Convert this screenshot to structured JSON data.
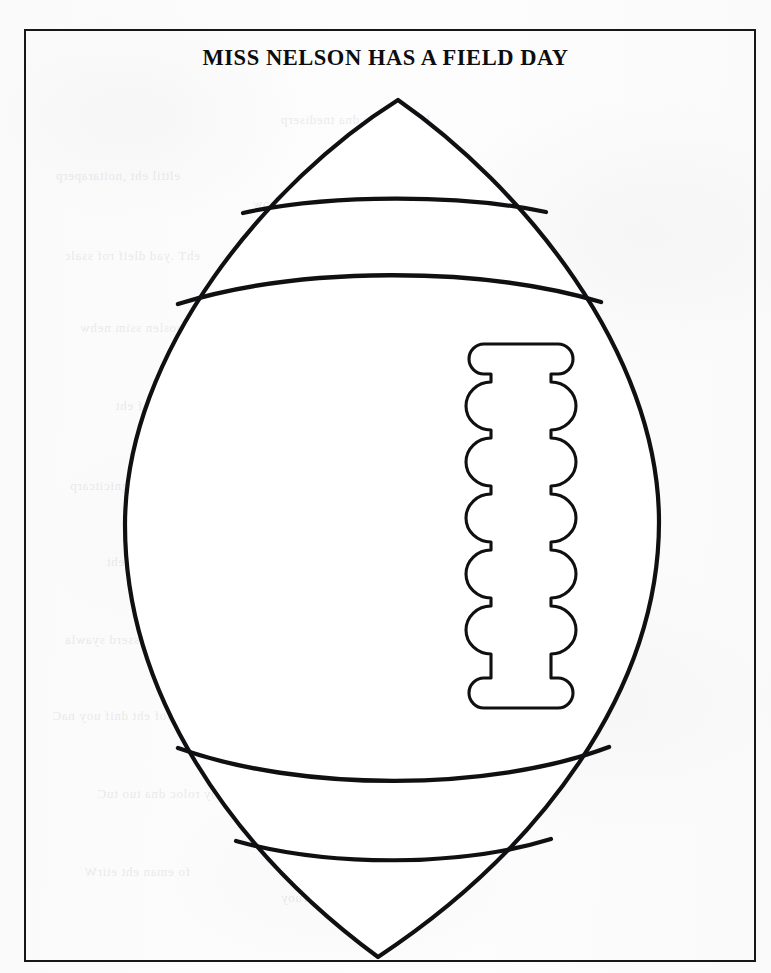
{
  "document": {
    "title": "MISS NELSON HAS A FIELD DAY",
    "page_width": 771,
    "page_height": 973,
    "background_color": "#fdfdfd",
    "ink_color": "#101012",
    "border_color": "#17171a",
    "type": "worksheet-template",
    "subject": "football cut-out / coloring template"
  },
  "frame": {
    "name": "page-border",
    "x": 24,
    "y": 29,
    "width": 732,
    "height": 933,
    "stroke_width": 2,
    "color": "#17171a"
  },
  "artwork": {
    "name": "american-football-outline",
    "stroke_color": "#101012",
    "fill_color": "#ffffff",
    "outline_stroke_width": 4,
    "stripe_stroke_width": 4,
    "lace_stroke_width": 3,
    "ball": {
      "top_tip": {
        "x": 398,
        "y": 100
      },
      "bottom_tip": {
        "x": 378,
        "y": 957
      },
      "left_extent": {
        "x": 125,
        "y": 528
      },
      "right_extent": {
        "x": 659,
        "y": 520
      },
      "center": {
        "x": 392,
        "y": 528
      }
    },
    "stripes": [
      {
        "name": "stripe-top-outer",
        "left_x": 243,
        "right_x": 546,
        "edge_y": 212,
        "apex_y": 196,
        "curve": "arc-up"
      },
      {
        "name": "stripe-top-inner",
        "left_x": 178,
        "right_x": 601,
        "edge_y": 303,
        "apex_y": 269,
        "curve": "arc-up"
      },
      {
        "name": "stripe-bottom-inner",
        "left_x": 178,
        "right_x": 609,
        "edge_y": 748,
        "apex_y": 779,
        "curve": "arc-down"
      },
      {
        "name": "stripe-bottom-outer",
        "left_x": 236,
        "right_x": 551,
        "edge_y": 840,
        "apex_y": 858,
        "curve": "arc-down"
      }
    ],
    "laces": {
      "name": "football-laces",
      "top_cap": {
        "x": 470,
        "y": 344,
        "width": 102,
        "height": 30
      },
      "bottom_cap": {
        "x": 470,
        "y": 678,
        "width": 102,
        "height": 30
      },
      "shaft_left_x": 491,
      "shaft_right_x": 551,
      "lobe_count": 6,
      "lobe_outer_left_x": 466,
      "lobe_outer_right_x": 576,
      "lobe_first_center_y": 406,
      "lobe_spacing_y": 50,
      "lobe_radius_y": 24
    }
  }
}
